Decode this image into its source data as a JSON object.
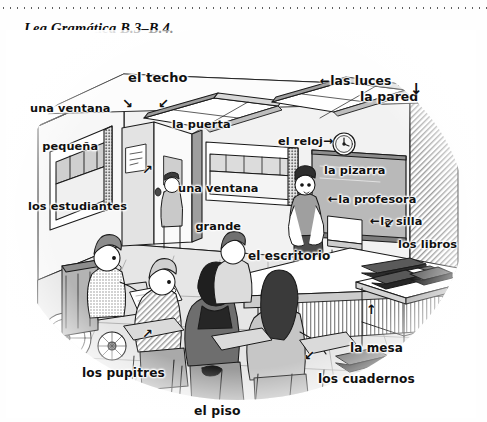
{
  "page": {
    "heading": "Lea Gramática B.3–B.4.",
    "background_color": "#ffffff",
    "ink_color": "#101010"
  },
  "illustration": {
    "name": "classroom-scene",
    "description": "Pen-and-ink classroom drawing with Spanish vocabulary labels and arrows",
    "style": "grayscale line art with halftone shading, oval vignette"
  },
  "labels": [
    {
      "id": "el-techo",
      "text": "el techo",
      "lines": [
        "el techo"
      ],
      "arrow": ""
    },
    {
      "id": "las-luces",
      "text": "las luces",
      "lines": [
        "las luces"
      ],
      "arrow": "←"
    },
    {
      "id": "la-pared",
      "text": "la pared",
      "lines": [
        "la pared"
      ],
      "arrow": "↓"
    },
    {
      "id": "una-ventana-pequena",
      "text": "una ventana pequeña",
      "lines": [
        "una ventana",
        "pequeña"
      ],
      "arrow": "↘"
    },
    {
      "id": "la-puerta",
      "text": "la puerta",
      "lines": [
        "la puerta"
      ],
      "arrow": "↙"
    },
    {
      "id": "el-reloj",
      "text": "el reloj",
      "lines": [
        "el reloj"
      ],
      "arrow": "→"
    },
    {
      "id": "la-pizarra",
      "text": "la pizarra",
      "lines": [
        "la pizarra"
      ],
      "arrow": ""
    },
    {
      "id": "la-profesora",
      "text": "la profesora",
      "lines": [
        "la profesora"
      ],
      "arrow": "←"
    },
    {
      "id": "la-silla",
      "text": "la silla",
      "lines": [
        "la silla"
      ],
      "arrow": "←"
    },
    {
      "id": "los-libros",
      "text": "los libros",
      "lines": [
        "los libros"
      ],
      "arrow": "↙"
    },
    {
      "id": "los-estudiantes",
      "text": "los estudiantes",
      "lines": [
        "los estudiantes"
      ],
      "arrow": "↗"
    },
    {
      "id": "una-ventana-grande",
      "text": "una ventana grande",
      "lines": [
        "una ventana",
        "grande"
      ],
      "arrow": ""
    },
    {
      "id": "el-escritorio",
      "text": "el escritorio",
      "lines": [
        "el escritorio"
      ],
      "arrow": ""
    },
    {
      "id": "los-pupitres",
      "text": "los pupitres",
      "lines": [
        "los pupitres"
      ],
      "arrow": "↗"
    },
    {
      "id": "el-piso",
      "text": "el piso",
      "lines": [
        "el piso"
      ],
      "arrow": ""
    },
    {
      "id": "la-mesa",
      "text": "la mesa",
      "lines": [
        "la mesa"
      ],
      "arrow": "↑"
    },
    {
      "id": "los-cuadernos",
      "text": "los cuadernos",
      "lines": [
        "los cuadernos"
      ],
      "arrow": "↙"
    }
  ]
}
